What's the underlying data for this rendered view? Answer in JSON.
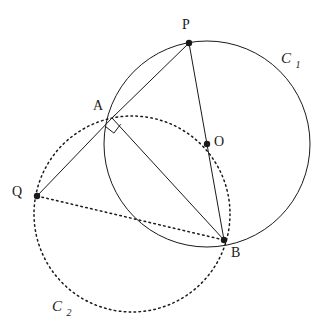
{
  "figure": {
    "background_color": "#ffffff",
    "stroke_color": "#1a1a1a",
    "width": 325,
    "height": 330
  },
  "points": [
    {
      "id": "P",
      "label": "P",
      "x": 189,
      "y": 43,
      "label_x": 186,
      "label_y": 29,
      "dot": true
    },
    {
      "id": "A",
      "label": "A",
      "x": 112,
      "y": 118,
      "label_x": 98,
      "label_y": 110,
      "dot": false
    },
    {
      "id": "O",
      "label": "O",
      "x": 207,
      "y": 144,
      "label_x": 214,
      "label_y": 146,
      "dot": true
    },
    {
      "id": "B",
      "label": "B",
      "x": 224,
      "y": 240,
      "label_x": 231,
      "label_y": 257,
      "dot": true
    },
    {
      "id": "Q",
      "label": "Q",
      "x": 37,
      "y": 196,
      "label_x": 17,
      "label_y": 196,
      "dot": true
    }
  ],
  "circles": [
    {
      "id": "C1",
      "label": "C",
      "subscript": "1",
      "cx": 207,
      "cy": 144,
      "r": 103,
      "style": "solid",
      "label_x": 286,
      "label_y": 63,
      "sub_x": 298,
      "sub_y": 68
    },
    {
      "id": "C2",
      "label": "C",
      "subscript": "2",
      "cx": 132,
      "cy": 214,
      "r": 98,
      "style": "dotted",
      "label_x": 57,
      "label_y": 311,
      "sub_x": 69,
      "sub_y": 316
    }
  ],
  "segments": [
    {
      "id": "PA",
      "from": "P",
      "to": "A",
      "style": "solid"
    },
    {
      "id": "PB",
      "from": "P",
      "to": "B",
      "style": "solid"
    },
    {
      "id": "AB",
      "from": "A",
      "to": "B",
      "style": "solid"
    },
    {
      "id": "QA",
      "from": "Q",
      "to": "A",
      "style": "solid"
    },
    {
      "id": "QB",
      "from": "Q",
      "to": "B",
      "style": "dotted"
    }
  ],
  "angle_marks": [
    {
      "id": "right-angle-at-A",
      "vertex": "A",
      "type": "right-angle",
      "size": 11,
      "path": "M 105.3 126.4 L 113.9 133.1 L 120.6 124.3"
    }
  ],
  "dot_radius": 3.2,
  "line_width": 1.0,
  "dot_pattern": "1.6 3.4"
}
